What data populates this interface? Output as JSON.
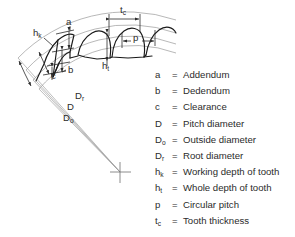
{
  "figure": {
    "type": "gear-tooth-nomenclature-diagram",
    "background_color": "#ffffff",
    "line_color": "#2b2b2b",
    "arc_color": "#8f8f8f"
  },
  "diagram_labels": [
    {
      "name": "label-a",
      "text": "a",
      "sub": "",
      "x": 66,
      "y": 22
    },
    {
      "name": "label-b",
      "text": "b",
      "sub": "",
      "x": 68,
      "y": 70
    },
    {
      "name": "label-c",
      "text": "c",
      "sub": "",
      "x": 51,
      "y": 76
    },
    {
      "name": "label-hk",
      "text": "h",
      "sub": "k",
      "x": 33,
      "y": 33
    },
    {
      "name": "label-ht",
      "text": "h",
      "sub": "t",
      "x": 102,
      "y": 66
    },
    {
      "name": "label-p",
      "text": "p",
      "sub": "",
      "x": 133,
      "y": 38
    },
    {
      "name": "label-tc",
      "text": "t",
      "sub": "c",
      "x": 113,
      "y": 10
    },
    {
      "name": "label-Dr",
      "text": "D",
      "sub": "r",
      "x": 75,
      "y": 96
    },
    {
      "name": "label-D",
      "text": "D",
      "sub": "",
      "x": 67,
      "y": 107
    },
    {
      "name": "label-Do",
      "text": "D",
      "sub": "o",
      "x": 63,
      "y": 118
    }
  ],
  "legend": {
    "entries": [
      {
        "symbol": "a",
        "sub": "",
        "equals": "=",
        "description": "Addendum"
      },
      {
        "symbol": "b",
        "sub": "",
        "equals": "=",
        "description": "Dedendum"
      },
      {
        "symbol": "c",
        "sub": "",
        "equals": "=",
        "description": "Clearance"
      },
      {
        "symbol": "D",
        "sub": "",
        "equals": "=",
        "description": "Pitch diameter"
      },
      {
        "symbol": "D",
        "sub": "o",
        "equals": "=",
        "description": "Outside diameter"
      },
      {
        "symbol": "D",
        "sub": "r",
        "equals": "=",
        "description": "Root diameter"
      },
      {
        "symbol": "h",
        "sub": "k",
        "equals": "=",
        "description": "Working depth of tooth"
      },
      {
        "symbol": "h",
        "sub": "t",
        "equals": "=",
        "description": "Whole depth of tooth"
      },
      {
        "symbol": "p",
        "sub": "",
        "equals": "=",
        "description": "Circular pitch"
      },
      {
        "symbol": "t",
        "sub": "c",
        "equals": "=",
        "description": "Tooth thickness"
      }
    ]
  }
}
